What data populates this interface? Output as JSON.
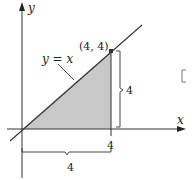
{
  "diagram": {
    "type": "region-under-line",
    "axes": {
      "x_label": "x",
      "y_label": "y"
    },
    "line": {
      "equation_label": "y = x"
    },
    "point": {
      "label": "(4, 4)",
      "x": 4,
      "y": 4
    },
    "x_tick": {
      "label": "4"
    },
    "height_dimension": {
      "label": "4"
    },
    "base_dimension": {
      "label": "4"
    },
    "region": {
      "shape": "triangle",
      "vertices": [
        [
          0,
          0
        ],
        [
          4,
          0
        ],
        [
          4,
          4
        ]
      ],
      "fill": "#c8c8c8"
    },
    "colors": {
      "axis": "#333333",
      "line": "#333333",
      "shade": "#c8c8c8"
    }
  }
}
